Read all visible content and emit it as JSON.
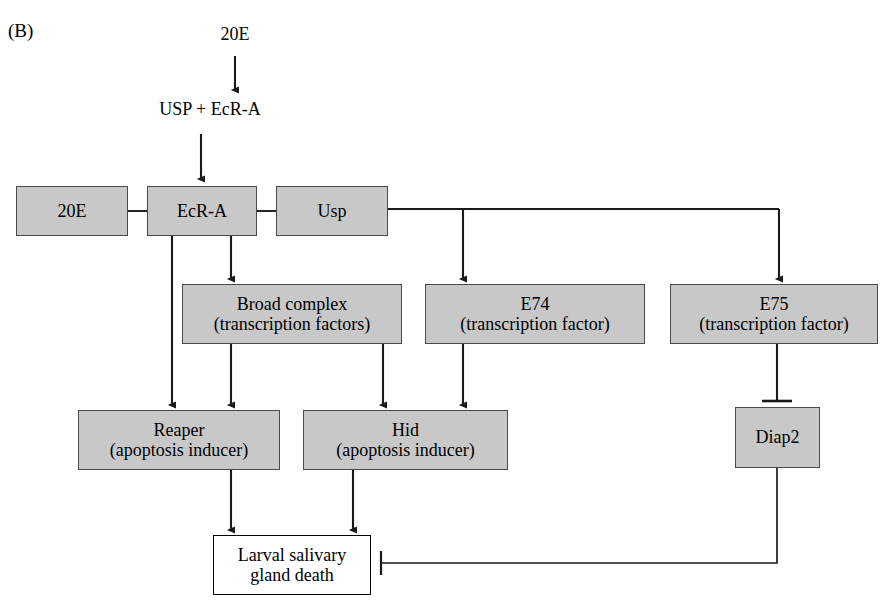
{
  "figure": {
    "panel_label": "(B)",
    "background_color": "#ffffff",
    "node_fill_color": "#c8c8c8",
    "node_border_color": "#4a4a4a",
    "terminal_node_fill_color": "#ffffff",
    "terminal_node_border_color": "#000000",
    "wire_color": "#1a1a1a"
  },
  "labels": {
    "hormone_input": "20E",
    "receptor_dimer": "USP + EcR-A"
  },
  "nodes": {
    "ligand_20e": {
      "line1": "20E",
      "line2": ""
    },
    "ecr_a": {
      "line1": "EcR-A",
      "line2": ""
    },
    "usp": {
      "line1": "Usp",
      "line2": ""
    },
    "broad_complex": {
      "line1": "Broad complex",
      "line2": "(transcription factors)"
    },
    "e74": {
      "line1": "E74",
      "line2": "(transcription factor)"
    },
    "e75": {
      "line1": "E75",
      "line2": "(transcription factor)"
    },
    "reaper": {
      "line1": "Reaper",
      "line2": "(apoptosis inducer)"
    },
    "hid": {
      "line1": "Hid",
      "line2": "(apoptosis inducer)"
    },
    "diap2": {
      "line1": "Diap2",
      "line2": ""
    },
    "outcome": {
      "line1": "Larval salivary",
      "line2": "gland death"
    }
  },
  "edges": [
    {
      "from": "hormone_input",
      "to": "receptor_dimer",
      "kind": "arrow"
    },
    {
      "from": "receptor_dimer",
      "to": "ecr_a",
      "kind": "arrow"
    },
    {
      "from": "ligand_20e",
      "to": "ecr_a",
      "kind": "link"
    },
    {
      "from": "ecr_a",
      "to": "usp",
      "kind": "link"
    },
    {
      "from": "ecr_a",
      "to": "broad_complex",
      "kind": "arrow"
    },
    {
      "from": "ecr_a",
      "to": "reaper",
      "kind": "arrow"
    },
    {
      "from": "usp",
      "to": "e74",
      "kind": "arrow"
    },
    {
      "from": "usp",
      "to": "e75",
      "kind": "arrow"
    },
    {
      "from": "broad_complex",
      "to": "reaper",
      "kind": "arrow"
    },
    {
      "from": "broad_complex",
      "to": "hid",
      "kind": "arrow"
    },
    {
      "from": "e74",
      "to": "hid",
      "kind": "arrow"
    },
    {
      "from": "e75",
      "to": "diap2",
      "kind": "inhibit"
    },
    {
      "from": "reaper",
      "to": "outcome",
      "kind": "arrow"
    },
    {
      "from": "hid",
      "to": "outcome",
      "kind": "arrow"
    },
    {
      "from": "diap2",
      "to": "outcome",
      "kind": "inhibit"
    }
  ]
}
